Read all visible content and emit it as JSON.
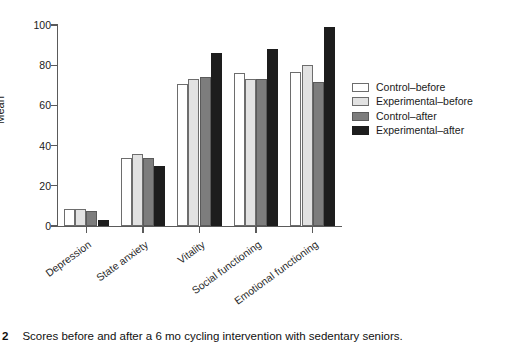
{
  "figure": {
    "caption_number": "2",
    "caption_text": "Scores before and after a 6 mo cycling intervention with sedentary seniors."
  },
  "legend": {
    "position": "right",
    "entries": [
      {
        "label": "Control–before",
        "color": "#ffffff"
      },
      {
        "label": "Experimental–before",
        "color": "#e2e2e2"
      },
      {
        "label": "Control–after",
        "color": "#7d7d7d"
      },
      {
        "label": "Experimental–after",
        "color": "#1d1d1d"
      }
    ]
  },
  "axes": {
    "ylabel": "Mean",
    "yticks": [
      "0",
      "20",
      "40",
      "60",
      "80",
      "100"
    ],
    "xlabel": ""
  },
  "chart_data": {
    "type": "bar",
    "title": "",
    "xlabel": "",
    "ylabel": "Mean",
    "ylim": [
      0,
      100
    ],
    "ytick_values": [
      0,
      20,
      40,
      60,
      80,
      100
    ],
    "grid": false,
    "legend_position": "right",
    "categories": [
      "Depression",
      "State anxiety",
      "Vitality",
      "Social functioning",
      "Emotional functioning"
    ],
    "series": [
      {
        "name": "Control–before",
        "color": "#ffffff",
        "values": [
          8.5,
          34.0,
          70.5,
          76.0,
          76.5
        ]
      },
      {
        "name": "Experimental–before",
        "color": "#e2e2e2",
        "values": [
          8.5,
          36.0,
          73.0,
          73.0,
          80.0
        ]
      },
      {
        "name": "Control–after",
        "color": "#7d7d7d",
        "values": [
          7.5,
          34.0,
          74.0,
          73.0,
          71.5
        ]
      },
      {
        "name": "Experimental–after",
        "color": "#1d1d1d",
        "values": [
          3.0,
          30.0,
          86.0,
          88.0,
          99.0
        ]
      }
    ]
  }
}
